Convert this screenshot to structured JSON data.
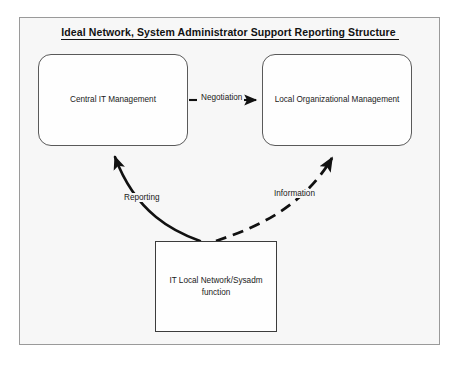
{
  "diagram": {
    "title": "Ideal Network, System Administrator Support Reporting Structure",
    "frame_border_color": "#9a9a9a",
    "frame_background": "#f7f7f7",
    "line_color": "#111111",
    "nodes": [
      {
        "id": "central",
        "label": "Central IT Management",
        "shape": "rounded-rectangle"
      },
      {
        "id": "local",
        "label": "Local Organizational Management",
        "shape": "rounded-rectangle"
      },
      {
        "id": "itlocal",
        "label_line1": "IT Local Network/Sysadm",
        "label_line2": "function",
        "shape": "rectangle"
      }
    ],
    "edges": [
      {
        "id": "negotiation",
        "label": "Negotiation",
        "from": "central",
        "to": "local",
        "style": "solid",
        "arrow": "right"
      },
      {
        "id": "reporting",
        "label": "Reporting",
        "from": "itlocal",
        "to": "central",
        "style": "solid",
        "arrow": "up-left"
      },
      {
        "id": "information",
        "label": "Information",
        "from": "itlocal",
        "to": "local",
        "style": "dashed",
        "arrow": "up-right"
      }
    ]
  }
}
